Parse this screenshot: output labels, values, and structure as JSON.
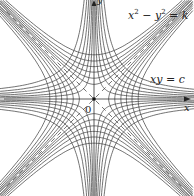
{
  "figure": {
    "labels": {
      "family1_equation": "x² − y² = k",
      "family1_left": "x",
      "family1_right": "− y",
      "family1_k": "= k",
      "family2_equation": "xy = c",
      "x_axis": "x",
      "y_axis": "y",
      "origin": "0"
    },
    "origin_px": [
      94,
      99
    ],
    "scale_px_per_unit": 19,
    "family1_k_values": [
      0.6,
      1.2,
      2.0,
      2.9,
      4.0,
      5.4
    ],
    "family2_c_values": [
      0.3,
      0.6,
      1.0,
      1.45,
      2.0,
      2.7
    ],
    "asymptotes": [
      "y = x",
      "y = -x"
    ],
    "colors": {
      "curve": "#444444",
      "axis": "#333333",
      "asymptote": "#333333",
      "text": "#222222",
      "background": "#ffffff"
    }
  }
}
